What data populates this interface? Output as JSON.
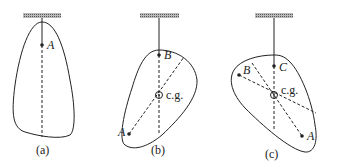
{
  "figure": {
    "panels": [
      {
        "id": "a",
        "caption": "(a)",
        "points": [
          {
            "label": "A"
          }
        ]
      },
      {
        "id": "b",
        "caption": "(b)",
        "points": [
          {
            "label": "B"
          },
          {
            "label": "A"
          }
        ],
        "center_label": "c.g."
      },
      {
        "id": "c",
        "caption": "(c)",
        "points": [
          {
            "label": "C"
          },
          {
            "label": "B"
          },
          {
            "label": "A"
          }
        ],
        "center_label": "c.g."
      }
    ],
    "colors": {
      "stroke": "#222222",
      "ceiling_hatch": "#888888",
      "background": "#ffffff"
    }
  }
}
